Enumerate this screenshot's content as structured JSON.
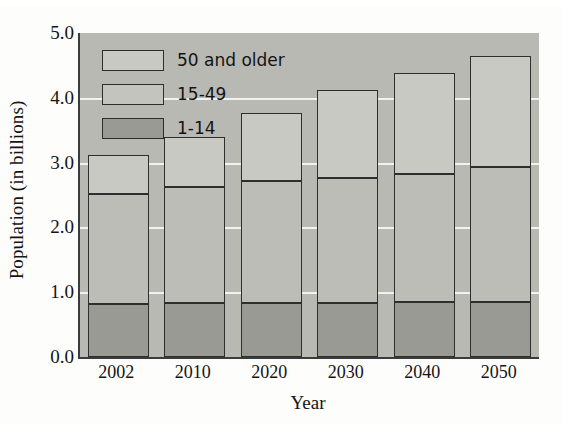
{
  "chart_data": {
    "type": "bar",
    "subtype": "stacked-vertical",
    "title": "",
    "xlabel": "Year",
    "ylabel": "Population (in billions)",
    "categories": [
      "2002",
      "2010",
      "2020",
      "2030",
      "2040",
      "2050"
    ],
    "ylim": [
      0.0,
      5.0
    ],
    "ytick_labels": [
      "0.0",
      "1.0",
      "2.0",
      "3.0",
      "4.0",
      "5.0"
    ],
    "ytick_values": [
      0.0,
      1.0,
      2.0,
      3.0,
      4.0,
      5.0
    ],
    "grid": "horizontal-white-gridlines",
    "legend_position": "upper-left-inside-plot",
    "stack_order_bottom_to_top": [
      "1-14",
      "15-49",
      "50 and older"
    ],
    "series": [
      {
        "name": "1-14",
        "color": "#9a9a95",
        "values": [
          0.82,
          0.83,
          0.83,
          0.83,
          0.85,
          0.85
        ]
      },
      {
        "name": "15-49",
        "color": "#bdbdb8",
        "values": [
          1.69,
          1.79,
          1.89,
          1.94,
          1.97,
          2.08
        ]
      },
      {
        "name": "50 and older",
        "color": "#c9c9c4",
        "values": [
          0.6,
          0.78,
          1.05,
          1.35,
          1.56,
          1.72
        ]
      }
    ],
    "cumulative_tops": [
      [
        0.82,
        2.51,
        3.11
      ],
      [
        0.83,
        2.62,
        3.4
      ],
      [
        0.83,
        2.72,
        3.77
      ],
      [
        0.83,
        2.77,
        4.12
      ],
      [
        0.85,
        2.82,
        4.38
      ],
      [
        0.85,
        2.93,
        4.65
      ]
    ],
    "totals": [
      3.11,
      3.4,
      3.77,
      4.12,
      4.38,
      4.65
    ],
    "plot_background_color": "#b9b9b4",
    "gridline_color": "#f2f2ee",
    "axis_color": "#3b3b3b"
  },
  "legend": {
    "items": [
      {
        "label": "50 and older",
        "key": "older"
      },
      {
        "label": "15-49",
        "key": "adult"
      },
      {
        "label": "1-14",
        "key": "child"
      }
    ]
  },
  "axes": {
    "y_title": "Population (in billions)",
    "x_title": "Year"
  }
}
